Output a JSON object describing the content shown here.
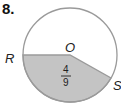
{
  "problem": {
    "number": "8.",
    "center_label": "O",
    "point_r_label": "R",
    "point_s_label": "S",
    "sector_fraction": {
      "numerator": "4",
      "denominator": "9"
    }
  },
  "colors": {
    "circle_stroke": "#9a9a9a",
    "shaded_fill": "#c4c4c4",
    "text": "#222222"
  }
}
